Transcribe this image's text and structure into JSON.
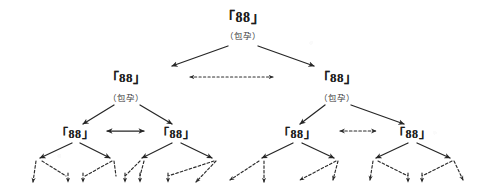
{
  "figure": {
    "type": "linguistic-tree-diagram",
    "background_color": "#ffffff",
    "ink_color": "#262626",
    "node_text": "「88」",
    "embedding_label": "（包孕）",
    "terminal_arrow_count": 16
  },
  "nodes": {
    "level1": [
      {
        "id": "root",
        "text": "「88」",
        "sublabel": "（包孕）",
        "x": 243,
        "y": 16,
        "sublabel_y": 35
      }
    ],
    "level2": [
      {
        "id": "l2-left",
        "text": "「88」",
        "sublabel": "（包孕）",
        "x": 126,
        "y": 76,
        "sublabel_y": 97
      },
      {
        "id": "l2-right",
        "text": "「88」",
        "sublabel": "（包孕）",
        "x": 337,
        "y": 76,
        "sublabel_y": 97
      }
    ],
    "level3": [
      {
        "id": "l3-a",
        "text": "「88」",
        "x": 75,
        "y": 133
      },
      {
        "id": "l3-b",
        "text": "「88」",
        "x": 176,
        "y": 133
      },
      {
        "id": "l3-c",
        "text": "「88」",
        "x": 297,
        "y": 133
      },
      {
        "id": "l3-d",
        "text": "「88」",
        "x": 412,
        "y": 133
      }
    ]
  },
  "connectors": {
    "branches_l1_l2": [
      {
        "from": "root",
        "to": "l2-left",
        "style": "solid"
      },
      {
        "from": "root",
        "to": "l2-right",
        "style": "solid"
      }
    ],
    "branches_l2_l3": [
      {
        "from": "l2-left",
        "to": "l3-a",
        "style": "solid"
      },
      {
        "from": "l2-left",
        "to": "l3-b",
        "style": "solid"
      },
      {
        "from": "l2-right",
        "to": "l3-c",
        "style": "solid"
      },
      {
        "from": "l2-right",
        "to": "l3-d",
        "style": "solid"
      }
    ],
    "horizontal": [
      {
        "id": "h-level2",
        "between": [
          "l2-left",
          "l2-right"
        ],
        "style": "dashed",
        "double_headed": true,
        "x1": 186,
        "x2": 277,
        "y": 77
      },
      {
        "id": "h-level3-left",
        "between": [
          "l3-a",
          "l3-b"
        ],
        "style": "solid",
        "double_headed": true,
        "x1": 104,
        "x2": 146,
        "y": 131
      },
      {
        "id": "h-level3-right",
        "between": [
          "l3-c",
          "l3-d"
        ],
        "style": "dashed",
        "double_headed": true,
        "x1": 337,
        "x2": 379,
        "y": 131
      }
    ]
  },
  "terminals": {
    "groups": [
      {
        "parent": "l3-a",
        "apex_x": 75,
        "spread": [
          36,
          112
        ],
        "tips": [
          [
            33,
            188
          ],
          [
            68,
            188
          ],
          [
            83,
            188
          ]
        ]
      },
      {
        "parent": "l3-b",
        "apex_x": 176,
        "spread": [
          137,
          212
        ],
        "tips": [
          [
            125,
            188
          ],
          [
            140,
            188
          ],
          [
            168,
            188
          ]
        ]
      },
      {
        "parent": "l3-c",
        "apex_x": 297,
        "spread": [
          258,
          334
        ],
        "tips": [
          [
            196,
            188
          ],
          [
            230,
            188
          ],
          [
            264,
            188
          ],
          [
            300,
            188
          ]
        ]
      },
      {
        "parent": "l3-d",
        "apex_x": 412,
        "spread": [
          373,
          450
        ],
        "tips": [
          [
            333,
            188
          ],
          [
            370,
            188
          ],
          [
            408,
            188
          ],
          [
            422,
            188
          ],
          [
            463,
            188
          ]
        ]
      }
    ]
  }
}
